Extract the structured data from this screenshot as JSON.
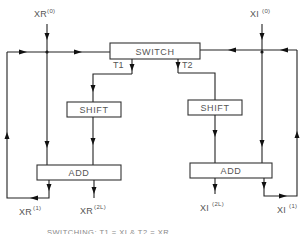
{
  "diagram": {
    "inputs": {
      "xr_input": {
        "base": "XR",
        "sup": "(0)"
      },
      "xi_input": {
        "base": "XI",
        "sup": "(0)"
      }
    },
    "blocks": {
      "switch": "SWITCH",
      "shift_left": "SHIFT",
      "shift_right": "SHIFT",
      "add_left": "ADD",
      "add_right": "ADD"
    },
    "branches": {
      "t1": "T1",
      "t2": "T2"
    },
    "outputs": {
      "xr_1": {
        "base": "XR",
        "sup": "(1)"
      },
      "xr_2l": {
        "base": "XR",
        "sup": "(2L)"
      },
      "xi_2l": {
        "base": "XI",
        "sup": "(2L)"
      },
      "xi_1": {
        "base": "XI",
        "sup": "(1)"
      }
    },
    "caption": "SWITCHING: T1 = XI & T2 = XR",
    "colors": {
      "line": "#222222",
      "text": "#555555",
      "background": "#ffffff"
    }
  }
}
